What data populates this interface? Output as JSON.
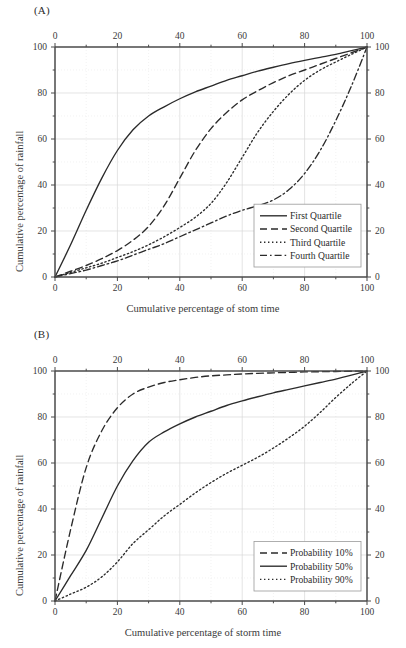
{
  "figure": {
    "background": "#ffffff",
    "axis_color": "#4a4a4a",
    "grid_color": "#d8d8d8",
    "curve_color": "#2b2b2b"
  },
  "panels": [
    {
      "id": "A",
      "label": "(A)",
      "xlabel": "Cumulative percentage of stom time",
      "ylabel": "Cumulative percentage of rainfall",
      "xticks": [
        0,
        20,
        40,
        60,
        80,
        100
      ],
      "yticks": [
        0,
        20,
        40,
        60,
        80,
        100
      ],
      "minor_xticks": [
        10,
        30,
        50,
        70,
        90
      ],
      "minor_yticks": [
        10,
        30,
        50,
        70,
        90
      ],
      "legend": {
        "position": "bottom-right",
        "items": [
          {
            "label": "First Quartile",
            "dash": "solid"
          },
          {
            "label": "Second Quartile",
            "dash": "dashed"
          },
          {
            "label": "Third Quartile",
            "dash": "dotted"
          },
          {
            "label": "Fourth Quartile",
            "dash": "dashdot"
          }
        ]
      }
    },
    {
      "id": "B",
      "label": "(B)",
      "xlabel": "Cumulative percentage of storm time",
      "ylabel": "Cumulative percentage of rainfall",
      "xticks": [
        0,
        20,
        40,
        60,
        80,
        100
      ],
      "yticks": [
        0,
        20,
        40,
        60,
        80,
        100
      ],
      "minor_xticks": [
        10,
        30,
        50,
        70,
        90
      ],
      "minor_yticks": [
        10,
        30,
        50,
        70,
        90
      ],
      "legend": {
        "position": "bottom-right",
        "items": [
          {
            "label": "Probability 10%",
            "dash": "dashed"
          },
          {
            "label": "Probability 50%",
            "dash": "solid"
          },
          {
            "label": "Probability 90%",
            "dash": "dotted"
          }
        ]
      }
    }
  ],
  "chart_data": [
    {
      "type": "line",
      "title": "(A)",
      "xlabel": "Cumulative percentage of stom time",
      "ylabel": "Cumulative percentage of rainfall",
      "xlim": [
        0,
        100
      ],
      "ylim": [
        0,
        100
      ],
      "grid": true,
      "legend_position": "lower right",
      "x": [
        0,
        5,
        10,
        15,
        20,
        25,
        30,
        35,
        40,
        45,
        50,
        55,
        60,
        65,
        70,
        75,
        80,
        85,
        90,
        95,
        100
      ],
      "series": [
        {
          "name": "First Quartile",
          "dash": "solid",
          "values": [
            0,
            14,
            29,
            43,
            55,
            64,
            70,
            74,
            77.5,
            80.5,
            83,
            85.5,
            87.5,
            89.5,
            91.2,
            92.8,
            94.2,
            95.5,
            96.8,
            98.4,
            100
          ]
        },
        {
          "name": "Second Quartile",
          "dash": "dashed",
          "values": [
            0,
            2.5,
            5,
            8,
            11.5,
            16,
            22,
            31,
            43,
            55,
            64.5,
            71.5,
            77,
            81,
            84.5,
            87.5,
            90,
            92.5,
            95,
            97.5,
            100
          ]
        },
        {
          "name": "Third Quartile",
          "dash": "dotted",
          "values": [
            0,
            2,
            4,
            6,
            8.5,
            11,
            14,
            17.5,
            21.5,
            26,
            32,
            41,
            52,
            63,
            72,
            79.5,
            85.5,
            90,
            93.5,
            96.8,
            100
          ]
        },
        {
          "name": "Fourth Quartile",
          "dash": "dashdot",
          "values": [
            0,
            1.5,
            3,
            5,
            7,
            9.5,
            12,
            14.5,
            17.5,
            20.5,
            23.5,
            26.5,
            29,
            31,
            33.5,
            38,
            45,
            55,
            68,
            83,
            100
          ]
        }
      ]
    },
    {
      "type": "line",
      "title": "(B)",
      "xlabel": "Cumulative percentage of storm time",
      "ylabel": "Cumulative percentage of rainfall",
      "xlim": [
        0,
        100
      ],
      "ylim": [
        0,
        100
      ],
      "grid": true,
      "legend_position": "lower right",
      "x": [
        0,
        5,
        10,
        15,
        20,
        25,
        30,
        35,
        40,
        45,
        50,
        55,
        60,
        65,
        70,
        75,
        80,
        85,
        90,
        95,
        100
      ],
      "series": [
        {
          "name": "Probability 10%",
          "dash": "dashed",
          "values": [
            0,
            31,
            58,
            74,
            84,
            90,
            93,
            95,
            96.2,
            97.2,
            97.9,
            98.3,
            98.7,
            99,
            99.2,
            99.4,
            99.6,
            99.7,
            99.8,
            99.9,
            100
          ]
        },
        {
          "name": "Probability 50%",
          "dash": "solid",
          "values": [
            0,
            11,
            22,
            36,
            50,
            61,
            69,
            73.5,
            77,
            80,
            82.5,
            85,
            87,
            88.8,
            90.5,
            92,
            93.5,
            95,
            96.5,
            98.2,
            100
          ]
        },
        {
          "name": "Probability 90%",
          "dash": "dotted",
          "values": [
            0,
            3,
            6,
            10.5,
            17,
            25,
            31,
            37,
            42,
            47,
            51.5,
            55.5,
            59,
            62.5,
            66.5,
            71,
            76,
            82,
            88.5,
            94.5,
            100
          ]
        }
      ]
    }
  ]
}
